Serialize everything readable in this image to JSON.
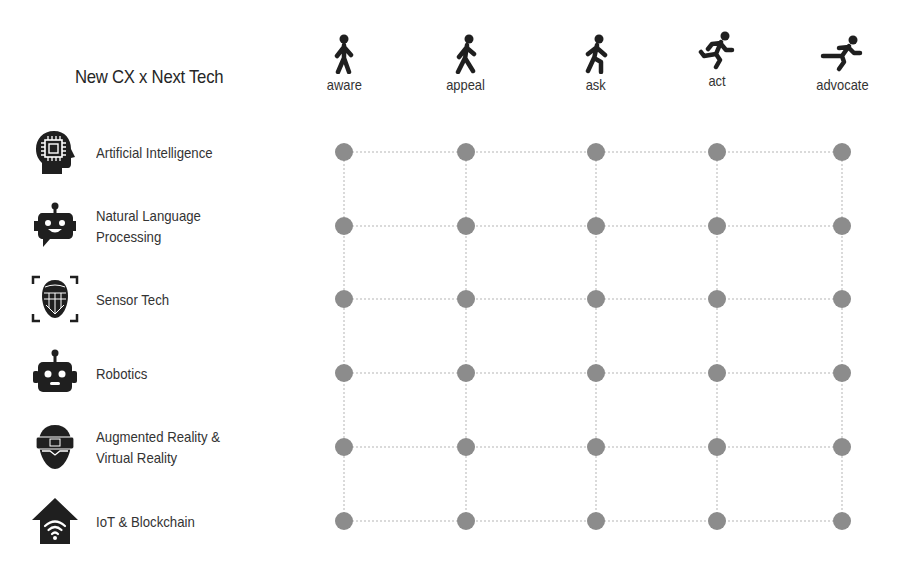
{
  "title": "New CX x Next Tech",
  "stages": [
    {
      "label": "aware",
      "icon": "standing-person-icon",
      "x": 344
    },
    {
      "label": "appeal",
      "icon": "walking-person-icon",
      "x": 466
    },
    {
      "label": "ask",
      "icon": "walking-fast-person-icon",
      "x": 596
    },
    {
      "label": "act",
      "icon": "running-person-icon",
      "x": 717
    },
    {
      "label": "advocate",
      "icon": "sprinting-person-icon",
      "x": 842
    }
  ],
  "technologies": [
    {
      "label": "Artificial Intelligence",
      "icon": "ai-head-chip-icon",
      "y": 152
    },
    {
      "label": "Natural Language\nProcessing",
      "line1": "Natural Language",
      "line2": "Processing",
      "icon": "chatbot-icon",
      "y": 226
    },
    {
      "label": "Sensor Tech",
      "icon": "face-scan-icon",
      "y": 299
    },
    {
      "label": "Robotics",
      "icon": "robot-icon",
      "y": 373
    },
    {
      "label": "Augmented Reality &\nVirtual Reality",
      "line1": "Augmented Reality &",
      "line2": "Virtual Reality",
      "icon": "vr-headset-icon",
      "y": 447
    },
    {
      "label": "IoT & Blockchain",
      "icon": "smart-home-wifi-icon",
      "y": 521
    }
  ],
  "colors": {
    "dot": "#8c8c8c",
    "gridline": "#b5b5b5",
    "icon": "#1f1f1f",
    "text": "#333333"
  }
}
